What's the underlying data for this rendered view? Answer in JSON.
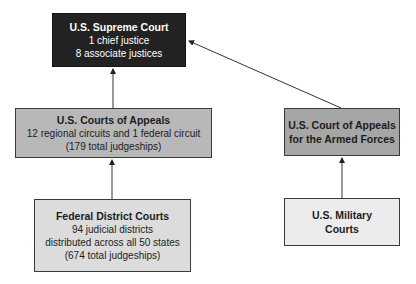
{
  "diagram": {
    "type": "hierarchy",
    "nodes": {
      "supreme": {
        "title": "U.S. Supreme Court",
        "lines": [
          "1 chief justice",
          "8 associate justices"
        ],
        "fill": "#222222"
      },
      "appeals": {
        "title": "U.S. Courts of Appeals",
        "lines": [
          "12 regional circuits and 1 federal circuit",
          "(179 total judgeships)"
        ],
        "fill": "#b8b8b8"
      },
      "armed": {
        "title_lines": [
          "U.S. Court of Appeals",
          "for the Armed Forces"
        ],
        "fill": "#a6a6a6"
      },
      "district": {
        "title": "Federal District Courts",
        "lines": [
          "94 judicial districts",
          "distributed across all 50 states",
          "(674 total judgeships)"
        ],
        "fill": "#dcdcdc"
      },
      "military": {
        "title_lines": [
          "U.S. Military",
          "Courts"
        ],
        "fill": "#ececec"
      }
    },
    "edges": [
      {
        "from": "appeals",
        "to": "supreme"
      },
      {
        "from": "armed",
        "to": "supreme"
      },
      {
        "from": "district",
        "to": "appeals"
      },
      {
        "from": "military",
        "to": "armed"
      }
    ]
  }
}
